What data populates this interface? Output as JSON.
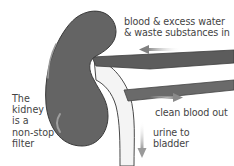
{
  "diagram": {
    "title": "The kidney is a non-stop filter",
    "left_caption_lines": [
      "The",
      "kidney",
      "is a",
      "non-stop",
      "filter"
    ],
    "labels": {
      "blood_in_line1": "blood & excess water",
      "blood_in_line2": "& waste substances in",
      "clean_out": "clean blood out",
      "urine_line1": "urine to",
      "urine_line2": "bladder"
    },
    "elements": {
      "kidney": {
        "fill": "#646464",
        "highlight": "#9a9a9a"
      },
      "renal_artery": {
        "fill": "#5e5e5e",
        "direction": "in"
      },
      "renal_vein": {
        "fill": "#6a6a6a",
        "direction": "out"
      },
      "ureter": {
        "fill": "#f2f2f2",
        "outline": "#555555",
        "direction": "down"
      },
      "arrows": {
        "color": "#8a8a8a"
      }
    }
  }
}
